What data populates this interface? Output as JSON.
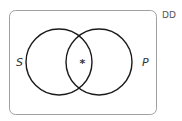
{
  "diagram": {
    "type": "venn",
    "corner_label": "DD",
    "sets": [
      {
        "name": "S",
        "label": "S"
      },
      {
        "name": "P",
        "label": "P"
      }
    ],
    "intersection_mark": "*",
    "colors": {
      "circle_stroke": "#1a1a1a",
      "box_stroke": "#9a9a9a",
      "text": "#333333"
    }
  }
}
